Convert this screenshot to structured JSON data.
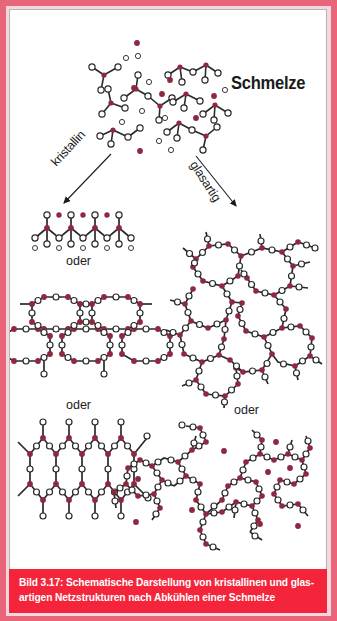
{
  "figure": {
    "title_label": "Schmelze",
    "branch_left_label": "kristallin",
    "branch_right_label": "glasartig",
    "alternative_label": "oder",
    "alternatives": {
      "left_first": "oder",
      "left_second": "oder",
      "right_first": "oder"
    },
    "caption": {
      "line1": "Bild 3.17: Schematische Darstellung von kristallinen und glas-",
      "line2": "artigen Netzstrukturen nach Abkühlen einer Schmelze"
    },
    "colors": {
      "frame": "#e8657a",
      "frame_inner": "#f3d9dd",
      "caption_bar": "#f4253b",
      "caption_text": "#ffffff",
      "network_former": "#8e2740",
      "bond": "#2a2a2a",
      "oxygen_fill": "#ffffff",
      "modifier_ion": "#8e2740",
      "text": "#1b1b1b"
    },
    "legend_semantics": {
      "filled_dark_red_circle": "network former / modifier cation",
      "small_open_circle": "oxygen ion",
      "line": "chemical bond"
    },
    "panels": [
      {
        "id": "melt",
        "name": "Schmelze (melt)",
        "column": "center",
        "description": "Disordered molecular fragments with free ions"
      },
      {
        "id": "crystal-chain",
        "name": "kristalline Kettenstruktur",
        "column": "left",
        "description": "Regular zig-zag chain"
      },
      {
        "id": "crystal-hex",
        "name": "kristallines Sechsecknetz",
        "column": "left",
        "description": "Regular honeycomb network"
      },
      {
        "id": "crystal-elong",
        "name": "kristallines gestrecktes Netz",
        "column": "left",
        "description": "Regular elongated hexagon network"
      },
      {
        "id": "glass-network",
        "name": "glasartiges Netzwerk",
        "column": "right",
        "description": "Irregular random ring network"
      },
      {
        "id": "glass-modified",
        "name": "glasartiges Netzwerk mit Netzwerkwandlern",
        "column": "right",
        "description": "Broken irregular network with modifier ions"
      }
    ]
  }
}
